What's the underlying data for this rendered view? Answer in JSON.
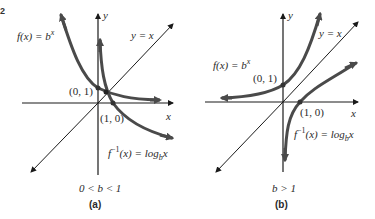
{
  "figure": {
    "colors": {
      "axis": "#1a1a1a",
      "curve": "#4a4a4a",
      "text": "#2a2a2a"
    },
    "panels": [
      {
        "id": "a",
        "caption": "(a)",
        "condition": "0 < b < 1",
        "axis_x_label": "x",
        "axis_y_label": "y",
        "line_label": "y = x",
        "exp_label_prefix": "f(x) = b",
        "exp_label_sup": "x",
        "log_label_prefix": "f",
        "log_label_sup": "−1",
        "log_label_mid": "(x) = log",
        "log_label_sub": "b",
        "log_label_end": "x",
        "point_exp": "(0, 1)",
        "point_log": "(1, 0)"
      },
      {
        "id": "b",
        "caption": "(b)",
        "condition": "b > 1",
        "axis_x_label": "x",
        "axis_y_label": "y",
        "line_label": "y = x",
        "exp_label_prefix": "f(x) = b",
        "exp_label_sup": "x",
        "log_label_prefix": "f",
        "log_label_sup": "−1",
        "log_label_mid": "(x) = log",
        "log_label_sub": "b",
        "log_label_end": "x",
        "point_exp": "(0, 1)",
        "point_log": "(1, 0)"
      }
    ]
  }
}
